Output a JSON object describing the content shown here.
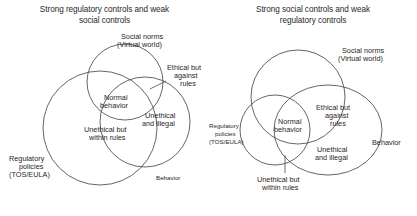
{
  "figure": {
    "background_color": "#ffffff",
    "stroke_color": "#4a4a4a",
    "text_color": "#1f1f1f"
  },
  "panels": [
    {
      "id": "left",
      "title_line1": "Strong regulatory controls and weak",
      "title_line2": "social controls",
      "sets": [
        {
          "name": "regulatory-policies",
          "label_line1": "Regulatory",
          "label_line2": "policies",
          "label_line3": "(TOS/EULA)"
        },
        {
          "name": "social-norms",
          "label_line1": "Social norms",
          "label_line2": "(Virtual world)"
        },
        {
          "name": "behavior",
          "label_line1": "Behavior"
        }
      ],
      "regions": [
        {
          "name": "normal-behavior",
          "label_line1": "Normal",
          "label_line2": "behavior"
        },
        {
          "name": "unethical-but-within-rules",
          "label_line1": "Unethical but",
          "label_line2": "within rules"
        },
        {
          "name": "unethical-and-illegal",
          "label_line1": "Unethical",
          "label_line2": "and illegal"
        },
        {
          "name": "ethical-but-against-rules",
          "label_line1": "Ethical but",
          "label_line2": "against",
          "label_line3": "rules"
        }
      ]
    },
    {
      "id": "right",
      "title_line1": "Strong social controls and weak",
      "title_line2": "regulatory controls",
      "sets": [
        {
          "name": "social-norms",
          "label_line1": "Social norms",
          "label_line2": "(Virtual world)"
        },
        {
          "name": "regulatory-policies",
          "label_line1": "Regulatory",
          "label_line2": "policies",
          "label_line3": "(TOS/EULA)"
        },
        {
          "name": "behavior",
          "label_line1": "Behavior"
        }
      ],
      "regions": [
        {
          "name": "normal-behavior",
          "label_line1": "Normal",
          "label_line2": "behavior"
        },
        {
          "name": "ethical-but-against-rules",
          "label_line1": "Ethical but",
          "label_line2": "against",
          "label_line3": "rules"
        },
        {
          "name": "unethical-and-illegal",
          "label_line1": "Unethical",
          "label_line2": "and illegal"
        },
        {
          "name": "unethical-but-within-rules",
          "label_line1": "Unethical but",
          "label_line2": "within rules"
        }
      ]
    }
  ]
}
